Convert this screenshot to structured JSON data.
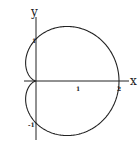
{
  "chart_data": {
    "type": "line",
    "title": "",
    "xlabel": "x",
    "ylabel": "y",
    "x_ticks": [
      {
        "value": 1,
        "label": "1"
      },
      {
        "value": 2,
        "label": "2"
      }
    ],
    "y_ticks": [
      {
        "value": 1,
        "label": "1"
      },
      {
        "value": -1,
        "label": "-1"
      }
    ],
    "xlim": [
      -0.3,
      2.3
    ],
    "ylim": [
      -1.6,
      1.8
    ],
    "grid": false,
    "legend": null,
    "series": [
      {
        "name": "cardioid",
        "equation": "r = 1 + cos θ",
        "color": "#222222",
        "key_points": [
          {
            "x": 2,
            "y": 0
          },
          {
            "x": 0,
            "y": 1
          },
          {
            "x": 0,
            "y": -1
          },
          {
            "x": 0,
            "y": 0
          },
          {
            "x": 0.75,
            "y": 1.3
          },
          {
            "x": 0.75,
            "y": -1.3
          },
          {
            "x": -0.25,
            "y": 0.43
          },
          {
            "x": -0.25,
            "y": -0.43
          }
        ]
      }
    ]
  },
  "labels": {
    "x_axis": "x",
    "y_axis": "y",
    "tick_x1": "1",
    "tick_x2": "2",
    "tick_y1": "1",
    "tick_yneg1": "-1"
  }
}
